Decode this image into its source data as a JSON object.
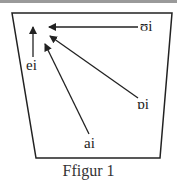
{
  "diagram": {
    "type": "vowel-trapezoid",
    "caption": "Ffigur 1",
    "labels": {
      "top_right": "ʊi",
      "left": "ei",
      "right": "ɒi",
      "bottom": "ai"
    },
    "colors": {
      "line": "#222222",
      "border": "#9a9a9a"
    }
  }
}
